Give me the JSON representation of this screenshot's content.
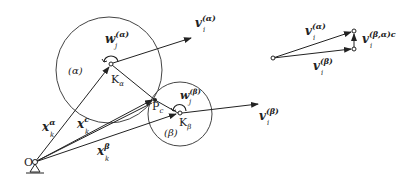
{
  "diagram": {
    "type": "kinematics-contact-diagram",
    "bodies": [
      {
        "id": "alpha",
        "label": "(α)",
        "center_label": "K",
        "center_sub": "α",
        "angular_velocity": {
          "sym": "w",
          "sub": "j",
          "sup": "(α)"
        },
        "linear_velocity": {
          "sym": "v",
          "sub": "i",
          "sup": "(α)"
        }
      },
      {
        "id": "beta",
        "label": "(β)",
        "center_label": "K",
        "center_sub": "β",
        "angular_velocity": {
          "sym": "w",
          "sub": "j",
          "sup": "(β)"
        },
        "linear_velocity": {
          "sym": "v",
          "sub": "i",
          "sup": "(β)"
        }
      }
    ],
    "origin": {
      "label": "O"
    },
    "contact_point": {
      "label": "P",
      "sub": "c"
    },
    "position_vectors": [
      {
        "sym": "x",
        "sub": "k",
        "sup": "α"
      },
      {
        "sym": "x",
        "sub": "k",
        "sup": "c"
      },
      {
        "sym": "x",
        "sub": "k",
        "sup": "β"
      }
    ],
    "velocity_diagram": {
      "v_alpha": {
        "sym": "v",
        "sub": "i",
        "sup": "(α)"
      },
      "v_beta": {
        "sym": "v",
        "sub": "i",
        "sup": "(β)"
      },
      "relative": {
        "sym": "v",
        "sub": "i",
        "sup": "(β,α)c"
      }
    }
  }
}
